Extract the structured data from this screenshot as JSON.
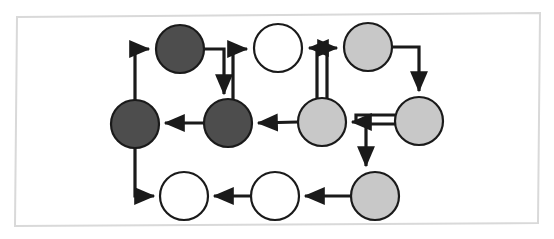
{
  "canvas": {
    "width": 554,
    "height": 239,
    "background": "#ffffff",
    "frame": {
      "name": "slide-frame-border",
      "stroke": "#d9d9d9",
      "stroke_width": 2,
      "points": "17,17 540,13 538,223 15,226"
    }
  },
  "palette": {
    "dark_node_fill": "#4d4d4d",
    "light_node_fill": "#c8c8c8",
    "white_node_fill": "#ffffff",
    "node_stroke": "#1a1a1a",
    "edge_stroke": "#1a1a1a",
    "frame_stroke": "#d9d9d9"
  },
  "chart_data": {
    "type": "diagram",
    "title": "",
    "node_radius": 24,
    "nodes": [
      {
        "id": "n1",
        "label": "",
        "shade": "dark",
        "fill": "#4d4d4d",
        "cx": 180,
        "cy": 49,
        "row": "top",
        "col": 2
      },
      {
        "id": "n2",
        "label": "",
        "shade": "white",
        "fill": "#ffffff",
        "cx": 278,
        "cy": 48,
        "row": "top",
        "col": 3
      },
      {
        "id": "n3",
        "label": "",
        "shade": "light",
        "fill": "#c8c8c8",
        "cx": 368,
        "cy": 47,
        "row": "top",
        "col": 5
      },
      {
        "id": "n4",
        "label": "",
        "shade": "dark",
        "fill": "#4d4d4d",
        "cx": 135,
        "cy": 124,
        "row": "middle",
        "col": 1
      },
      {
        "id": "n5",
        "label": "",
        "shade": "dark",
        "fill": "#4d4d4d",
        "cx": 228,
        "cy": 123,
        "row": "middle",
        "col": 2
      },
      {
        "id": "n6",
        "label": "",
        "shade": "light",
        "fill": "#c8c8c8",
        "cx": 322,
        "cy": 122,
        "row": "middle",
        "col": 4
      },
      {
        "id": "n7",
        "label": "",
        "shade": "light",
        "fill": "#c8c8c8",
        "cx": 419,
        "cy": 121,
        "row": "middle",
        "col": 6
      },
      {
        "id": "n8",
        "label": "",
        "shade": "light",
        "fill": "#c8c8c8",
        "cx": 375,
        "cy": 196,
        "row": "bottom",
        "col": 5
      },
      {
        "id": "n9",
        "label": "",
        "shade": "white",
        "fill": "#ffffff",
        "cx": 275,
        "cy": 196,
        "row": "bottom",
        "col": 3
      },
      {
        "id": "n10",
        "label": "",
        "shade": "white",
        "fill": "#ffffff",
        "cx": 184,
        "cy": 196,
        "row": "bottom",
        "col": 2
      }
    ],
    "edges": [
      {
        "id": "e1",
        "from": "n4",
        "to": "n1",
        "style": "elbow-up-right",
        "arrow": "n1"
      },
      {
        "id": "e2",
        "from": "n1",
        "to": "n5",
        "style": "elbow-right-down",
        "arrow": "n5"
      },
      {
        "id": "e3",
        "from": "n5",
        "to": "n2",
        "style": "elbow-up-right",
        "arrow": "n2"
      },
      {
        "id": "e4",
        "from": "n5",
        "to": "n4",
        "style": "straight-left",
        "arrow": "n4"
      },
      {
        "id": "e5",
        "from": "n6",
        "to": "n5",
        "style": "straight-left",
        "arrow": "n5"
      },
      {
        "id": "e6",
        "from": "n6",
        "to": "n2",
        "style": "elbow-up-left",
        "arrow": "n2"
      },
      {
        "id": "e7",
        "from": "n6",
        "to": "n3",
        "style": "elbow-up-right",
        "arrow": "n3"
      },
      {
        "id": "e8",
        "from": "n3",
        "to": "n7",
        "style": "elbow-right-down",
        "arrow": "n7"
      },
      {
        "id": "e9",
        "from": "n7",
        "to": "n6",
        "style": "straight-left",
        "arrow": "n6"
      },
      {
        "id": "e10",
        "from": "n7",
        "to": "n8",
        "style": "elbow-left-down",
        "arrow": "n8"
      },
      {
        "id": "e11",
        "from": "n8",
        "to": "n9",
        "style": "straight-left",
        "arrow": "n9"
      },
      {
        "id": "e12",
        "from": "n9",
        "to": "n10",
        "style": "straight-left",
        "arrow": "n10"
      },
      {
        "id": "e13",
        "from": "n4",
        "to": "n10",
        "style": "elbow-down-right",
        "arrow": "n10"
      }
    ],
    "legend": [],
    "annotations": []
  }
}
